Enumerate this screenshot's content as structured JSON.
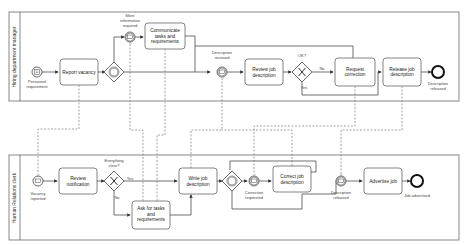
{
  "diagram": {
    "type": "BPMN collaboration",
    "lanes": [
      {
        "id": "hdm",
        "label": "Hiring department manager"
      },
      {
        "id": "hr",
        "label": "Human Relations clerk"
      }
    ],
    "hdm": {
      "start_event": "Personnel requirement",
      "task_report": "Report vacancy",
      "msg_more_info": "More information required",
      "task_communicate": [
        "Communicate",
        "tasks and",
        "requirements"
      ],
      "msg_desc_received": "Description received",
      "task_review": [
        "Review job",
        "description"
      ],
      "gw_ok": "OK?",
      "gw_no": "No",
      "gw_yes": "Yes",
      "task_request": [
        "Request",
        "correction"
      ],
      "task_release": [
        "Release job",
        "description"
      ],
      "end_event": [
        "Description",
        "released"
      ]
    },
    "hr": {
      "start_event": [
        "Vacancy",
        "reported"
      ],
      "task_review_notif": [
        "Review",
        "notification"
      ],
      "gw_clear": [
        "Everything",
        "clear?"
      ],
      "gw_yes": "Yes",
      "gw_no": "No",
      "task_ask": [
        "Ask for tasks",
        "and",
        "requirements"
      ],
      "task_write": [
        "Write job",
        "description"
      ],
      "msg_correction": [
        "Correction",
        "requested"
      ],
      "task_correct": [
        "Correct job",
        "description"
      ],
      "msg_released": [
        "Description",
        "released"
      ],
      "task_advertise": "Advertise job",
      "end_event": "Job advertised"
    }
  }
}
